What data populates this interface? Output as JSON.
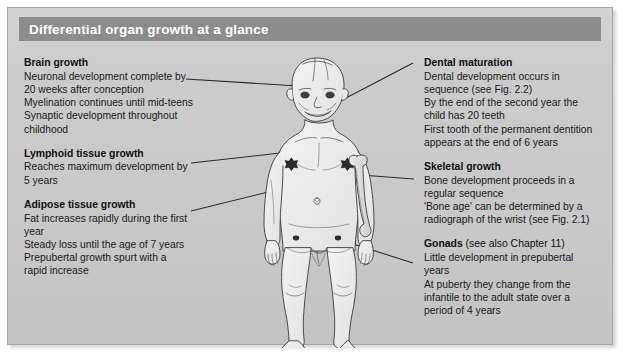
{
  "card": {
    "title": "Differential organ growth at a glance",
    "title_bar_color": "#8c8c8c",
    "background_color": "#c9c9c9",
    "text_color": "#1a1a1a"
  },
  "left_column": [
    {
      "name": "brain-growth",
      "title": "Brain growth",
      "lines": [
        "Neuronal development complete by",
        "20 weeks after conception",
        "Myelination continues until mid-teens",
        "Synaptic development throughout",
        "childhood"
      ]
    },
    {
      "name": "lymphoid-tissue-growth",
      "title": "Lymphoid tissue growth",
      "lines": [
        "Reaches maximum development by",
        "5 years"
      ]
    },
    {
      "name": "adipose-tissue-growth",
      "title": "Adipose tissue growth",
      "lines": [
        "Fat increases rapidly during the first",
        "year",
        "Steady loss until the age of 7 years",
        "Prepubertal growth spurt with a",
        "rapid increase"
      ]
    }
  ],
  "right_column": [
    {
      "name": "dental-maturation",
      "title": "Dental maturation",
      "title_suffix": "",
      "lines": [
        "Dental development occurs in",
        "sequence (see Fig. 2.2)",
        "By the end of the second year the",
        "child has 20 teeth",
        "First tooth of the permanent dentition",
        "appears at the end of 6 years"
      ]
    },
    {
      "name": "skeletal-growth",
      "title": "Skeletal growth",
      "title_suffix": "",
      "lines": [
        "Bone development proceeds in a",
        "regular sequence",
        "'Bone age' can be determined by a",
        "radiograph of the wrist (see Fig. 2.1)"
      ]
    },
    {
      "name": "gonads",
      "title": "Gonads",
      "title_suffix": " (see also Chapter 11)",
      "lines": [
        "Little development in prepubertal",
        "years",
        "At puberty they change from the",
        "infantile to the adult state over a",
        "period of 4 years"
      ]
    }
  ],
  "figure": {
    "name": "toddler-anatomy-illustration",
    "annotated_sites": [
      "head-brain",
      "mouth-teeth",
      "left-nipple-lymphoid",
      "abdomen-adipose",
      "upper-arm-bone-skeletal",
      "groin-gonads"
    ]
  },
  "leader_lines": [
    {
      "name": "leader-brain",
      "from": [
        178,
        71
      ],
      "to": [
        290,
        78
      ]
    },
    {
      "name": "leader-dental",
      "from": [
        405,
        55
      ],
      "to": [
        313,
        103
      ]
    },
    {
      "name": "leader-lymphoid",
      "from": [
        183,
        155
      ],
      "to": [
        272,
        145
      ]
    },
    {
      "name": "leader-adipose",
      "from": [
        183,
        203
      ],
      "to": [
        285,
        178
      ]
    },
    {
      "name": "leader-skeletal",
      "from": [
        406,
        171
      ],
      "to": [
        326,
        165
      ]
    },
    {
      "name": "leader-gonads",
      "from": [
        405,
        255
      ],
      "to": [
        298,
        221
      ]
    }
  ]
}
